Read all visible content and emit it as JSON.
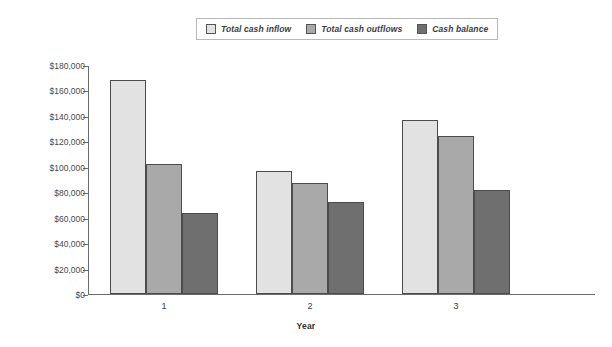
{
  "chart_data": {
    "type": "bar",
    "title": "",
    "subtitle": "",
    "xlabel": "Year",
    "ylabel": "",
    "categories": [
      "1",
      "2",
      "3"
    ],
    "series": [
      {
        "name": "Total cash inflow",
        "color": "#e2e2e2",
        "values": [
          168000,
          97000,
          136500
        ]
      },
      {
        "name": "Total cash outflows",
        "color": "#a9a9a9",
        "values": [
          102500,
          87500,
          124000
        ]
      },
      {
        "name": "Cash balance",
        "color": "#6f6f6f",
        "values": [
          64000,
          72500,
          82000
        ]
      }
    ],
    "ylim": [
      0,
      180000
    ],
    "ytick_step": 20000,
    "ytick_labels": [
      "$180,000",
      "$160,000",
      "$140,000",
      "$120,000",
      "$100,000",
      "$80,000",
      "$60,000",
      "$40,000",
      "$20,000",
      "$0"
    ],
    "ytick_values": [
      180000,
      160000,
      140000,
      120000,
      100000,
      80000,
      60000,
      40000,
      20000,
      0
    ],
    "grid": false,
    "legend_position": "top-center",
    "axis_color": "#6b6b6b",
    "background": "#ffffff"
  },
  "legend": {
    "items": [
      {
        "label": "Total cash inflow"
      },
      {
        "label": "Total cash outflows"
      },
      {
        "label": "Cash balance"
      }
    ]
  }
}
